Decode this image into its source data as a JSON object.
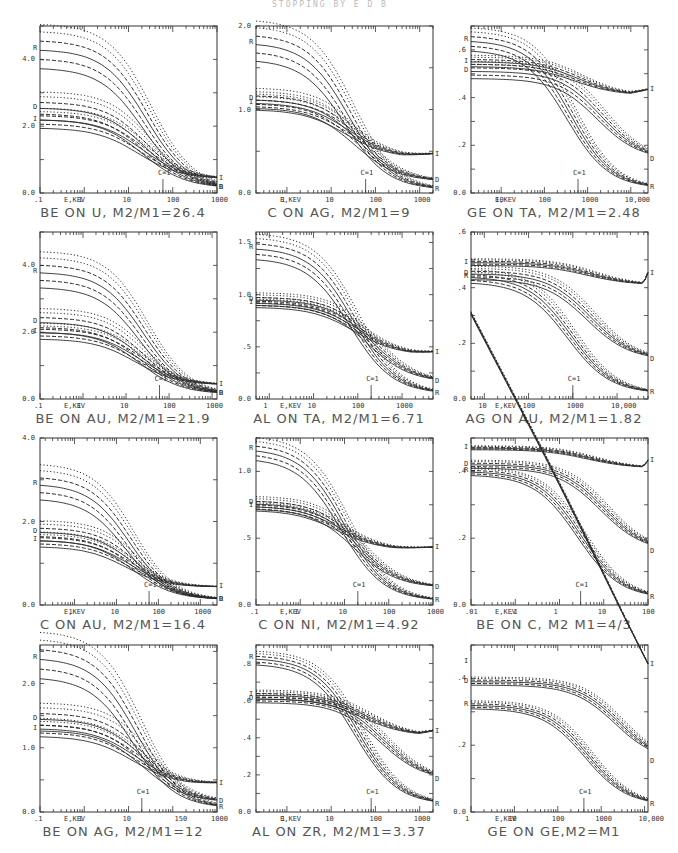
{
  "header": {
    "text": "STOPPING BY E D B"
  },
  "chart_data": [
    {
      "type": "line",
      "title": "BE ON U, M2/M1=26.4",
      "caption": "BE ON U, M2/M1=26.4",
      "xlabel": "E,KEV",
      "xscale": "log",
      "xlim": [
        0.1,
        1000
      ],
      "xticks": [
        ".1",
        "1",
        "10",
        "100",
        "1000"
      ],
      "ylim": [
        0,
        5.0
      ],
      "yticks": [
        {
          "v": 0,
          "t": "0.0"
        },
        {
          "v": 2,
          "t": "2.0"
        },
        {
          "v": 4,
          "t": "4.0"
        }
      ],
      "marker_label": "C=1",
      "marker_x": 60,
      "groups": [
        {
          "label": "R",
          "start": 4.3,
          "end": 0.15,
          "mid": 25,
          "spread": 0.55,
          "floor": 0.15
        },
        {
          "label": "D",
          "start": 2.55,
          "end": 0.15,
          "mid": 25,
          "spread": 0.35,
          "floor": 0.15
        },
        {
          "label": "I",
          "start": 2.2,
          "end": 0.42,
          "mid": 20,
          "spread": 0.25,
          "floor": 0.42
        }
      ],
      "end_labels": [
        "I",
        "D",
        "R"
      ]
    },
    {
      "type": "line",
      "title": "C ON AG, M2/M1=9",
      "caption": "C ON AG, M2/M1=9",
      "xlabel": "E,KEV",
      "xscale": "log",
      "xlim": [
        0.2,
        2000
      ],
      "xticks": [
        "1",
        "10",
        "100",
        "1000"
      ],
      "ylim": [
        0,
        2.0
      ],
      "yticks": [
        {
          "v": 0,
          "t": "0.0"
        },
        {
          "v": 1,
          "t": "1.0"
        },
        {
          "v": 2,
          "t": "2.0"
        }
      ],
      "marker_label": "C=1",
      "marker_x": 60,
      "groups": [
        {
          "label": "R",
          "start": 1.8,
          "end": 0.04,
          "mid": 25,
          "spread": 0.2,
          "floor": 0.04
        },
        {
          "label": "D",
          "start": 1.12,
          "end": 0.14,
          "mid": 40,
          "spread": 0.1,
          "floor": 0.14
        },
        {
          "label": "I",
          "start": 1.08,
          "end": 0.46,
          "mid": 25,
          "spread": 0.08,
          "floor": 0.42
        }
      ],
      "end_labels": [
        "I",
        "D",
        "R"
      ]
    },
    {
      "type": "line",
      "title": "GE ON TA, M2/M1=2.48",
      "caption": "GE ON TA, M2/M1=2.48",
      "xlabel": "E,KEV",
      "xscale": "log",
      "xlim": [
        2,
        25000
      ],
      "xticks": [
        "10",
        "100",
        "1000",
        "10,000"
      ],
      "ylim": [
        0,
        0.7
      ],
      "yticks": [
        {
          "v": 0,
          "t": "0.0"
        },
        {
          "v": 0.2,
          "t": ".2"
        },
        {
          "v": 0.4,
          "t": ".4"
        },
        {
          "v": 0.6,
          "t": ".6"
        }
      ],
      "marker_label": "C=1",
      "marker_x": 600,
      "groups": [
        {
          "label": "R",
          "start": 0.64,
          "end": 0.02,
          "mid": 400,
          "spread": 0.04,
          "floor": 0.02
        },
        {
          "label": "I",
          "start": 0.55,
          "end": 0.43,
          "mid": 600,
          "spread": 0.02,
          "floor": 0.41
        },
        {
          "label": "D",
          "start": 0.51,
          "end": 0.14,
          "mid": 2000,
          "spread": 0.03,
          "floor": 0.14
        }
      ],
      "end_labels": [
        "I",
        "D",
        "R"
      ]
    },
    {
      "type": "line",
      "title": "BE ON AU, M2/M1=21.9",
      "caption": "BE ON AU, M2/M1=21.9",
      "xlabel": "E,KEV",
      "xscale": "log",
      "xlim": [
        0.1,
        1300
      ],
      "xticks": [
        ".1",
        "1",
        "10",
        "100",
        "1000"
      ],
      "ylim": [
        0,
        5.0
      ],
      "yticks": [
        {
          "v": 0,
          "t": "0.0"
        },
        {
          "v": 2,
          "t": "2.0"
        },
        {
          "v": 4,
          "t": "4.0"
        }
      ],
      "marker_label": "C=1",
      "marker_x": 60,
      "groups": [
        {
          "label": "R",
          "start": 3.8,
          "end": 0.15,
          "mid": 25,
          "spread": 0.45,
          "floor": 0.15
        },
        {
          "label": "D",
          "start": 2.3,
          "end": 0.15,
          "mid": 25,
          "spread": 0.3,
          "floor": 0.15
        },
        {
          "label": "I",
          "start": 2.0,
          "end": 0.42,
          "mid": 20,
          "spread": 0.2,
          "floor": 0.42
        }
      ],
      "end_labels": [
        "I",
        "D"
      ]
    },
    {
      "type": "line",
      "title": "AL ON TA, M2/M1=6.71",
      "caption": "AL ON TA, M2/M1=6.71",
      "xlabel": "E,KEV",
      "xscale": "log",
      "xlim": [
        0.5,
        5000
      ],
      "xticks": [
        "1",
        "10",
        "100",
        "1000"
      ],
      "ylim": [
        0,
        1.6
      ],
      "yticks": [
        {
          "v": 0,
          "t": "0.0"
        },
        {
          "v": 0.5,
          "t": ".5"
        },
        {
          "v": 1.0,
          "t": "1.0"
        },
        {
          "v": 1.5,
          "t": "1.5"
        }
      ],
      "marker_label": "C=1",
      "marker_x": 200,
      "groups": [
        {
          "label": "R",
          "start": 1.45,
          "end": 0.05,
          "mid": 80,
          "spread": 0.1,
          "floor": 0.05
        },
        {
          "label": "D",
          "start": 0.95,
          "end": 0.16,
          "mid": 200,
          "spread": 0.05,
          "floor": 0.16
        },
        {
          "label": "I",
          "start": 0.92,
          "end": 0.44,
          "mid": 100,
          "spread": 0.04,
          "floor": 0.42
        }
      ],
      "end_labels": [
        "I",
        "D",
        "R"
      ]
    },
    {
      "type": "line",
      "title": "AG ON AU, M2/M1=1.82",
      "caption": "AG ON AU, M2/M1=1.82",
      "xlabel": "E,KEV",
      "xscale": "log",
      "xlim": [
        5,
        50000
      ],
      "xticks": [
        "10",
        "100",
        "1000",
        "10,000"
      ],
      "ylim": [
        0,
        0.6
      ],
      "yticks": [
        {
          "v": 0,
          "t": "0.0"
        },
        {
          "v": 0.2,
          "t": ".2"
        },
        {
          "v": 0.4,
          "t": ".4"
        },
        {
          "v": 0.6,
          "t": ".6"
        }
      ],
      "marker_label": "C=1",
      "marker_x": 1000,
      "groups": [
        {
          "label": "I",
          "start": 0.49,
          "end": 0.45,
          "mid": 2500,
          "spread": 0.01,
          "floor": 0.41
        },
        {
          "label": "D",
          "start": 0.45,
          "end": 0.14,
          "mid": 2500,
          "spread": 0.02,
          "floor": 0.14
        },
        {
          "label": "R",
          "start": 0.44,
          "end": 0.02,
          "mid": 900,
          "spread": 0.02,
          "floor": 0.02
        }
      ],
      "end_labels": [
        "I",
        "D",
        "R"
      ]
    },
    {
      "type": "line",
      "title": "C ON AU, M2/M1=16.4",
      "caption": "C ON AU, M2/M1=16.4",
      "xlabel": "E,KEV",
      "xscale": "log",
      "xlim": [
        0.15,
        2500
      ],
      "xticks": [
        "1",
        "10",
        "100",
        "1000"
      ],
      "ylim": [
        0,
        4.0
      ],
      "yticks": [
        {
          "v": 0,
          "t": "0.0"
        },
        {
          "v": 2,
          "t": "2.0"
        },
        {
          "v": 4,
          "t": "4.0"
        }
      ],
      "marker_label": "C=1",
      "marker_x": 60,
      "groups": [
        {
          "label": "R",
          "start": 2.9,
          "end": 0.13,
          "mid": 20,
          "spread": 0.35,
          "floor": 0.13
        },
        {
          "label": "D",
          "start": 1.75,
          "end": 0.13,
          "mid": 30,
          "spread": 0.2,
          "floor": 0.13
        },
        {
          "label": "I",
          "start": 1.55,
          "end": 0.43,
          "mid": 20,
          "spread": 0.15,
          "floor": 0.42
        }
      ],
      "end_labels": [
        "I",
        "D"
      ]
    },
    {
      "type": "line",
      "title": "C ON NI, M2/M1=4.92",
      "caption": "C ON NI, M2/M1=4.92",
      "xlabel": "E,KEV",
      "xscale": "log",
      "xlim": [
        0.1,
        1000
      ],
      "xticks": [
        ".1",
        "1",
        "10",
        "100",
        "1000"
      ],
      "ylim": [
        0,
        1.25
      ],
      "yticks": [
        {
          "v": 0,
          "t": "0.0"
        },
        {
          "v": 0.5,
          "t": ".5"
        },
        {
          "v": 1.0,
          "t": "1.0"
        }
      ],
      "marker_label": "C=1",
      "marker_x": 20,
      "groups": [
        {
          "label": "R",
          "start": 1.17,
          "end": 0.03,
          "mid": 10,
          "spread": 0.07,
          "floor": 0.03
        },
        {
          "label": "D",
          "start": 0.76,
          "end": 0.13,
          "mid": 20,
          "spread": 0.04,
          "floor": 0.13
        },
        {
          "label": "I",
          "start": 0.74,
          "end": 0.43,
          "mid": 8,
          "spread": 0.03,
          "floor": 0.41
        }
      ],
      "end_labels": [
        "I",
        "D",
        "R"
      ]
    },
    {
      "type": "line",
      "title": "BE ON C, M2/M1=4/3",
      "caption": "BE ON C, M2 M1=4/3",
      "xlabel": "E,KEV",
      "xscale": "log",
      "xlim": [
        0.01,
        100
      ],
      "xticks": [
        ".01",
        ".1",
        "1",
        "10",
        "100"
      ],
      "ylim": [
        0,
        0.5
      ],
      "yticks": [
        {
          "v": 0,
          "t": "0.0"
        },
        {
          "v": 0.2,
          "t": ".2"
        },
        {
          "v": 0.4,
          "t": ".4"
        }
      ],
      "marker_label": "C=1",
      "marker_x": 3,
      "groups": [
        {
          "label": "I",
          "start": 0.47,
          "end": 0.43,
          "mid": 5,
          "spread": 0.005,
          "floor": 0.41
        },
        {
          "label": "D",
          "start": 0.42,
          "end": 0.16,
          "mid": 10,
          "spread": 0.01,
          "floor": 0.16
        },
        {
          "label": "R",
          "start": 0.4,
          "end": 0.02,
          "mid": 3,
          "spread": 0.01,
          "floor": 0.02
        }
      ],
      "end_labels": [
        "I",
        "D",
        "R"
      ]
    },
    {
      "type": "line",
      "title": "BE ON AG, M2/M1=12",
      "caption": "BE ON AG, M2/M1=12",
      "xlabel": "E,KEV",
      "xscale": "log",
      "xlim": [
        0.1,
        1000
      ],
      "xticks": [
        ".1",
        "1",
        "10",
        "150",
        "1000"
      ],
      "ylim": [
        0,
        2.6
      ],
      "yticks": [
        {
          "v": 0,
          "t": "0.0"
        },
        {
          "v": 1,
          "t": "1.0"
        },
        {
          "v": 2,
          "t": "2.0"
        }
      ],
      "marker_label": "C=1",
      "marker_x": 20,
      "groups": [
        {
          "label": "R",
          "start": 2.4,
          "end": 0.06,
          "mid": 15,
          "spread": 0.3,
          "floor": 0.06
        },
        {
          "label": "D",
          "start": 1.45,
          "end": 0.15,
          "mid": 25,
          "spread": 0.18,
          "floor": 0.15
        },
        {
          "label": "I",
          "start": 1.3,
          "end": 0.44,
          "mid": 15,
          "spread": 0.12,
          "floor": 0.42
        }
      ],
      "end_labels": [
        "I",
        "D",
        "R"
      ]
    },
    {
      "type": "line",
      "title": "AL ON ZR, M2/M1=3.37",
      "caption": "AL ON ZR, M2/M1=3.37",
      "xlabel": "E,KEV",
      "xscale": "log",
      "xlim": [
        0.2,
        2000
      ],
      "xticks": [
        "1",
        "10",
        "100",
        "1000"
      ],
      "ylim": [
        0,
        0.9
      ],
      "yticks": [
        {
          "v": 0,
          "t": "0.0"
        },
        {
          "v": 0.2,
          "t": ".2"
        },
        {
          "v": 0.4,
          "t": ".4"
        },
        {
          "v": 0.6,
          "t": ".6"
        },
        {
          "v": 0.8,
          "t": ".8"
        }
      ],
      "marker_label": "C=1",
      "marker_x": 80,
      "groups": [
        {
          "label": "R",
          "start": 0.83,
          "end": 0.04,
          "mid": 40,
          "spread": 0.03,
          "floor": 0.04
        },
        {
          "label": "I",
          "start": 0.63,
          "end": 0.43,
          "mid": 60,
          "spread": 0.02,
          "floor": 0.41
        },
        {
          "label": "D",
          "start": 0.61,
          "end": 0.17,
          "mid": 150,
          "spread": 0.02,
          "floor": 0.17
        }
      ],
      "end_labels": [
        "I",
        "D",
        "R"
      ]
    },
    {
      "type": "line",
      "title": "GE ON GE, M2=M1",
      "caption": "GE ON GE,M2=M1",
      "xlabel": "E,KEV",
      "xscale": "log",
      "xlim": [
        1,
        12000
      ],
      "xticks": [
        "1",
        "10",
        "100",
        "1000",
        "10,000"
      ],
      "ylim": [
        0,
        0.5
      ],
      "yticks": [
        {
          "v": 0,
          "t": "0.0"
        },
        {
          "v": 0.2,
          "t": ".2"
        },
        {
          "v": 0.4,
          "t": ".4"
        }
      ],
      "marker_label": "C=1",
      "marker_x": 400,
      "groups": [
        {
          "label": "I",
          "start": 0.45,
          "end": 0.44,
          "mid": 1000,
          "spread": 0.004,
          "floor": 0.41
        },
        {
          "label": "D",
          "start": 0.39,
          "end": 0.15,
          "mid": 2500,
          "spread": 0.01,
          "floor": 0.15
        },
        {
          "label": "R",
          "start": 0.32,
          "end": 0.02,
          "mid": 500,
          "spread": 0.01,
          "floor": 0.02
        }
      ],
      "end_labels": [
        "I",
        "D",
        "R"
      ]
    }
  ]
}
